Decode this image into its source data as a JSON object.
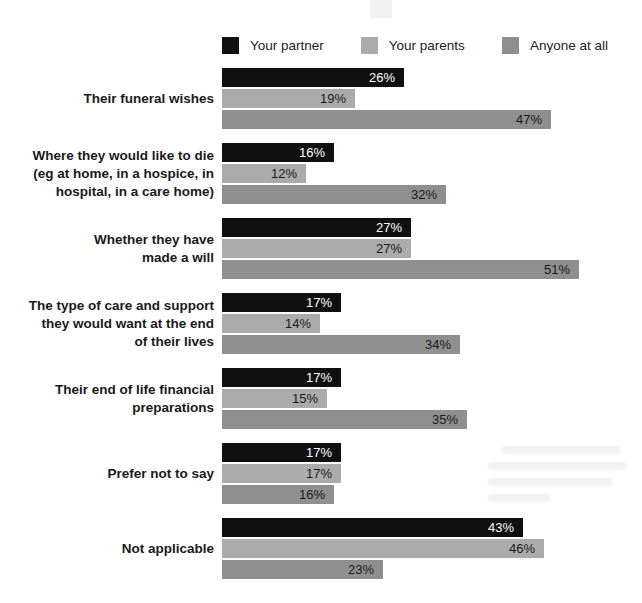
{
  "page": {
    "background": "#ffffff"
  },
  "chart_data": {
    "type": "bar",
    "orientation": "horizontal",
    "title": "",
    "xlabel": "",
    "ylabel": "",
    "xlim": [
      0,
      55
    ],
    "grid": false,
    "legend_position": "top",
    "value_suffix": "%",
    "px_per_percent": 7,
    "series": [
      {
        "name": "Your partner",
        "color": "#101010",
        "value_label_color": "#ffffff",
        "values": [
          26,
          16,
          27,
          17,
          17,
          17,
          43
        ]
      },
      {
        "name": "Your parents",
        "color": "#ababab",
        "value_label_color": "#1a1a1a",
        "values": [
          19,
          12,
          27,
          14,
          15,
          17,
          46
        ]
      },
      {
        "name": "Anyone at all",
        "color": "#8f8f8f",
        "value_label_color": "#1a1a1a",
        "values": [
          47,
          32,
          51,
          34,
          35,
          16,
          23
        ]
      }
    ],
    "categories": [
      {
        "label": "Their funeral wishes",
        "lines": [
          "Their funeral wishes"
        ]
      },
      {
        "label": "Where they would like to die (eg at home, in a hospice, in hospital, in a care home)",
        "lines": [
          "Where they would like to die",
          "(eg at home, in a hospice, in",
          "hospital, in a care home)"
        ]
      },
      {
        "label": "Whether they have made a will",
        "lines": [
          "Whether they have",
          "made a will"
        ]
      },
      {
        "label": "The type of care and support they would want at the end of their lives",
        "lines": [
          "The type of care and support",
          "they would want at the end",
          "of their lives"
        ]
      },
      {
        "label": "Their end of life financial preparations",
        "lines": [
          "Their end of life financial",
          "preparations"
        ]
      },
      {
        "label": "Prefer not to say",
        "lines": [
          "Prefer not to say"
        ]
      },
      {
        "label": "Not applicable",
        "lines": [
          "Not applicable"
        ]
      }
    ]
  }
}
